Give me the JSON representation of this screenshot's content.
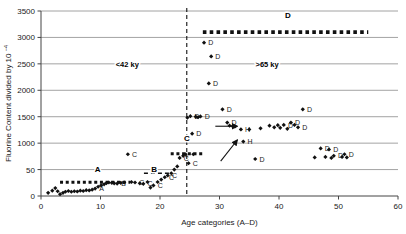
{
  "chart_data": {
    "type": "scatter",
    "title": "",
    "xlabel": "Age categories (A–D)",
    "ylabel": "Fluorine Content divided by 10",
    "ylabel_exponent": "−4",
    "xlim": [
      0,
      60
    ],
    "ylim": [
      0,
      3500
    ],
    "xticks": [
      0,
      10,
      20,
      30,
      40,
      50,
      60
    ],
    "xticklabels": [
      "0",
      "10",
      "20",
      "30",
      "40",
      "50",
      "60"
    ],
    "yticks": [
      0,
      500,
      1000,
      1500,
      2000,
      2500,
      3000,
      3500
    ],
    "yticklabels": [
      "0",
      "50",
      "1000",
      "1500",
      "2000",
      "2500",
      "3000",
      "3500"
    ],
    "grid": "horizontal",
    "legend_position": "none",
    "annotations": [
      {
        "name": "era-left",
        "text": "<42 ky",
        "x": 14.5,
        "y": 2500
      },
      {
        "name": "era-right",
        "text": ">65 ky",
        "x": 38.0,
        "y": 2500
      },
      {
        "name": "band-a",
        "text": "A",
        "x": 9.5,
        "y": 520
      },
      {
        "name": "band-b",
        "text": "B",
        "x": 19.0,
        "y": 520
      },
      {
        "name": "band-c",
        "text": "C",
        "x": 24.5,
        "y": 1100
      },
      {
        "name": "band-d",
        "text": "D",
        "x": 41.5,
        "y": 3420
      }
    ],
    "divider": {
      "name": "age-divider",
      "x": 24.5,
      "style": "dashed",
      "color": "#111111"
    },
    "level_lines": [
      {
        "name": "level-line-a",
        "y": 260,
        "x0": 3.2,
        "x1": 15.0,
        "style": "dotted",
        "weight": 3.0
      },
      {
        "name": "level-line-b",
        "y": 430,
        "x0": 17.3,
        "x1": 21.6,
        "style": "dashed",
        "weight": 1.6
      },
      {
        "name": "level-line-c",
        "y": 800,
        "x0": 21.8,
        "x1": 27.3,
        "style": "dotted",
        "weight": 3.0
      },
      {
        "name": "level-line-d",
        "y": 3100,
        "x0": 27.2,
        "x1": 55.0,
        "style": "dotted",
        "weight": 3.6
      }
    ],
    "arrows": [
      {
        "name": "arrow-to-cluster-h1",
        "x0": 29.3,
        "y0": 1320,
        "x1": 33.0,
        "y1": 1320
      },
      {
        "name": "arrow-to-cluster-h2",
        "x0": 30.2,
        "y0": 660,
        "x1": 33.0,
        "y1": 1060
      }
    ],
    "series": [
      {
        "name": "fluorine-samples",
        "marker": "diamond",
        "color": "#111111",
        "points": [
          {
            "x": 1.2,
            "y": 60,
            "label": ""
          },
          {
            "x": 1.9,
            "y": 100,
            "label": ""
          },
          {
            "x": 2.4,
            "y": 150,
            "label": ""
          },
          {
            "x": 2.8,
            "y": 90,
            "label": ""
          },
          {
            "x": 3.2,
            "y": 35,
            "label": ""
          },
          {
            "x": 3.7,
            "y": 60,
            "label": ""
          },
          {
            "x": 4.1,
            "y": 80,
            "label": ""
          },
          {
            "x": 4.6,
            "y": 95,
            "label": ""
          },
          {
            "x": 5.1,
            "y": 80,
            "label": ""
          },
          {
            "x": 5.6,
            "y": 90,
            "label": ""
          },
          {
            "x": 6.1,
            "y": 85,
            "label": ""
          },
          {
            "x": 6.6,
            "y": 100,
            "label": ""
          },
          {
            "x": 7.1,
            "y": 95,
            "label": ""
          },
          {
            "x": 7.6,
            "y": 110,
            "label": ""
          },
          {
            "x": 8.1,
            "y": 105,
            "label": ""
          },
          {
            "x": 8.6,
            "y": 120,
            "label": ""
          },
          {
            "x": 9.1,
            "y": 140,
            "label": "A"
          },
          {
            "x": 9.6,
            "y": 175,
            "label": ""
          },
          {
            "x": 10.1,
            "y": 200,
            "label": ""
          },
          {
            "x": 10.6,
            "y": 220,
            "label": ""
          },
          {
            "x": 11.0,
            "y": 245,
            "label": ""
          },
          {
            "x": 11.4,
            "y": 255,
            "label": ""
          },
          {
            "x": 11.9,
            "y": 250,
            "label": ""
          },
          {
            "x": 12.3,
            "y": 240,
            "label": ""
          },
          {
            "x": 12.8,
            "y": 235,
            "label": "B"
          },
          {
            "x": 13.4,
            "y": 250,
            "label": ""
          },
          {
            "x": 14.0,
            "y": 255,
            "label": ""
          },
          {
            "x": 14.6,
            "y": 790,
            "label": "C"
          },
          {
            "x": 15.2,
            "y": 265,
            "label": ""
          },
          {
            "x": 15.8,
            "y": 255,
            "label": "C"
          },
          {
            "x": 16.6,
            "y": 240,
            "label": ""
          },
          {
            "x": 17.2,
            "y": 230,
            "label": "C"
          },
          {
            "x": 17.9,
            "y": 265,
            "label": ""
          },
          {
            "x": 18.4,
            "y": 160,
            "label": ""
          },
          {
            "x": 18.9,
            "y": 200,
            "label": "C"
          },
          {
            "x": 19.6,
            "y": 265,
            "label": ""
          },
          {
            "x": 20.2,
            "y": 310,
            "label": ""
          },
          {
            "x": 20.8,
            "y": 355,
            "label": "C"
          },
          {
            "x": 21.3,
            "y": 390,
            "label": "C"
          },
          {
            "x": 21.9,
            "y": 430,
            "label": ""
          },
          {
            "x": 22.4,
            "y": 500,
            "label": ""
          },
          {
            "x": 22.9,
            "y": 560,
            "label": ""
          },
          {
            "x": 23.3,
            "y": 720,
            "label": "C"
          },
          {
            "x": 23.9,
            "y": 760,
            "label": ""
          },
          {
            "x": 24.3,
            "y": 790,
            "label": ""
          },
          {
            "x": 24.6,
            "y": 1480,
            "label": ""
          },
          {
            "x": 24.8,
            "y": 620,
            "label": "C"
          },
          {
            "x": 25.1,
            "y": 1510,
            "label": "D"
          },
          {
            "x": 25.4,
            "y": 1180,
            "label": "D"
          },
          {
            "x": 25.6,
            "y": 790,
            "label": ""
          },
          {
            "x": 26.0,
            "y": 1500,
            "label": ""
          },
          {
            "x": 26.4,
            "y": 1490,
            "label": ""
          },
          {
            "x": 26.8,
            "y": 1505,
            "label": "D"
          },
          {
            "x": 27.4,
            "y": 2900,
            "label": "D"
          },
          {
            "x": 28.6,
            "y": 2640,
            "label": "D"
          },
          {
            "x": 28.2,
            "y": 2130,
            "label": "D"
          },
          {
            "x": 30.5,
            "y": 1640,
            "label": "D"
          },
          {
            "x": 31.3,
            "y": 1390,
            "label": "D"
          },
          {
            "x": 31.7,
            "y": 1330,
            "label": ""
          },
          {
            "x": 32.2,
            "y": 1320,
            "label": ""
          },
          {
            "x": 32.6,
            "y": 1315,
            "label": ""
          },
          {
            "x": 33.6,
            "y": 1260,
            "label": "H"
          },
          {
            "x": 34.0,
            "y": 1030,
            "label": "H"
          },
          {
            "x": 35.0,
            "y": 1260,
            "label": ""
          },
          {
            "x": 36.0,
            "y": 700,
            "label": "D"
          },
          {
            "x": 36.9,
            "y": 1280,
            "label": ""
          },
          {
            "x": 38.4,
            "y": 1330,
            "label": ""
          },
          {
            "x": 39.2,
            "y": 1300,
            "label": ""
          },
          {
            "x": 39.8,
            "y": 1340,
            "label": ""
          },
          {
            "x": 40.2,
            "y": 1290,
            "label": ""
          },
          {
            "x": 40.8,
            "y": 1345,
            "label": "D"
          },
          {
            "x": 41.4,
            "y": 1270,
            "label": ""
          },
          {
            "x": 42.0,
            "y": 1390,
            "label": "D"
          },
          {
            "x": 42.6,
            "y": 1345,
            "label": ""
          },
          {
            "x": 43.2,
            "y": 1300,
            "label": "D"
          },
          {
            "x": 44.0,
            "y": 1640,
            "label": "D"
          },
          {
            "x": 46.0,
            "y": 730,
            "label": ""
          },
          {
            "x": 47.0,
            "y": 900,
            "label": "D"
          },
          {
            "x": 47.8,
            "y": 740,
            "label": ""
          },
          {
            "x": 48.4,
            "y": 880,
            "label": "D"
          },
          {
            "x": 48.8,
            "y": 720,
            "label": ""
          },
          {
            "x": 49.2,
            "y": 760,
            "label": "D"
          },
          {
            "x": 50.6,
            "y": 740,
            "label": ""
          },
          {
            "x": 51.0,
            "y": 790,
            "label": "D"
          },
          {
            "x": 51.4,
            "y": 730,
            "label": ""
          }
        ]
      }
    ]
  }
}
